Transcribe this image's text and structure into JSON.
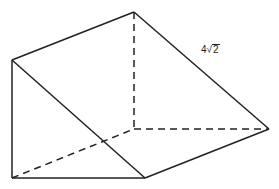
{
  "diagram": {
    "type": "triangular-prism",
    "edge_label": {
      "coefficient": "4",
      "radical_symbol": "√",
      "radicand": "2"
    },
    "vertices": {
      "top_back": [
        134,
        12
      ],
      "top_front": [
        12,
        60
      ],
      "back_corner": [
        134,
        129
      ],
      "right": [
        269,
        129
      ],
      "bottom_left": [
        12,
        178
      ],
      "bottom_right": [
        145,
        178
      ]
    },
    "colors": {
      "stroke": "#222222",
      "background": "#ffffff"
    }
  }
}
